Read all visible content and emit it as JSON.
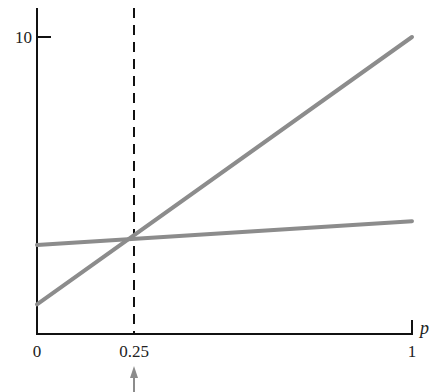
{
  "chart_data": {
    "type": "line",
    "title": "",
    "xlabel": "p",
    "ylabel": "",
    "xlim": [
      0,
      1
    ],
    "ylim": [
      0,
      10
    ],
    "grid": false,
    "x_ticks": [
      "0",
      "0.25",
      "1"
    ],
    "y_ticks": [
      "10"
    ],
    "series": [
      {
        "name": "steep line",
        "x": [
          0,
          1
        ],
        "y": [
          1,
          10
        ],
        "color": "#8c8c8c"
      },
      {
        "name": "flat line",
        "x": [
          0,
          1
        ],
        "y": [
          3,
          3.8
        ],
        "color": "#8c8c8c"
      }
    ],
    "annotations": [
      {
        "type": "vertical-dashed-line",
        "x": 0.25,
        "color": "#111111"
      },
      {
        "type": "arrow",
        "x": 0.25,
        "direction": "up",
        "position": "below x-axis",
        "color": "#8c8c8c"
      }
    ]
  },
  "labels": {
    "x0": "0",
    "x025": "0.25",
    "x1": "1",
    "y10": "10",
    "xaxis": "p"
  }
}
